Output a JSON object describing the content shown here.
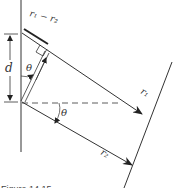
{
  "diagram": {
    "type": "two-slit path difference geometry",
    "labels": {
      "path_difference": "r₁ − r₂",
      "separation": "d",
      "angle_top": "θ",
      "angle_bottom": "θ",
      "ray_top": "r₁",
      "ray_bottom": "r₂"
    },
    "caption": "Figure 14.15",
    "colors": {
      "line": "#333333",
      "background": "#ffffff"
    }
  }
}
